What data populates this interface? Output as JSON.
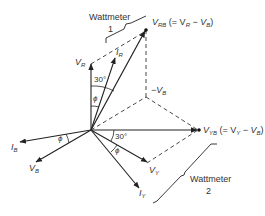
{
  "labels": {
    "wattmeter1": {
      "line1": "Wattmeter",
      "line2": "1"
    },
    "wattmeter2": {
      "line1": "Wattmeter",
      "line2": "2"
    },
    "vrb": {
      "main": "V",
      "sub": "RB",
      "eq_open": " (= V",
      "eq_sub1": "R",
      "eq_mid": " − V",
      "eq_sub2": "B",
      "eq_close": ")"
    },
    "vyb": {
      "main": "V",
      "sub": "YB",
      "eq_open": " (= V",
      "eq_sub1": "Y",
      "eq_mid": " − V",
      "eq_sub2": "B",
      "eq_close": ")"
    },
    "vr": {
      "main": "V",
      "sub": "R"
    },
    "ir": {
      "main": "I",
      "sub": "R"
    },
    "neg_vb": {
      "main": "−V",
      "sub": "B"
    },
    "vy": {
      "main": "V",
      "sub": "Y"
    },
    "iy": {
      "main": "I",
      "sub": "Y"
    },
    "vb": {
      "main": "V",
      "sub": "B"
    },
    "ib": {
      "main": "I",
      "sub": "B"
    },
    "angle_30_top": "30°",
    "angle_30_right": "30°",
    "phi_top": "ϕ",
    "phi_right": "ϕ",
    "phi_left": "ϕ"
  },
  "colors": {
    "line": "#222222",
    "text": "#333333",
    "background": "#ffffff"
  }
}
